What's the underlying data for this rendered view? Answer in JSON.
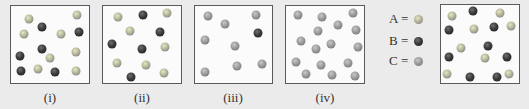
{
  "colors": {
    "background": "#ebebeb",
    "box_fill": "#fbfbfb",
    "box_border": "#5a5a5a",
    "A": "#bfc0a0",
    "B": "#2e2e2e",
    "C": "#9a9a9a"
  },
  "legend": [
    {
      "label": "A =",
      "type": "A"
    },
    {
      "label": "B =",
      "type": "B"
    },
    {
      "label": "C =",
      "type": "C"
    }
  ],
  "boxes": [
    {
      "label": "(i)",
      "x": 10,
      "y": 5,
      "w": 80,
      "h": 79,
      "spheres": [
        {
          "t": "A",
          "x": 29,
          "y": 19
        },
        {
          "t": "A",
          "x": 77,
          "y": 15
        },
        {
          "t": "B",
          "x": 42,
          "y": 27
        },
        {
          "t": "A",
          "x": 24,
          "y": 34
        },
        {
          "t": "A",
          "x": 61,
          "y": 34
        },
        {
          "t": "B",
          "x": 79,
          "y": 32
        },
        {
          "t": "B",
          "x": 42,
          "y": 49
        },
        {
          "t": "B",
          "x": 20,
          "y": 56
        },
        {
          "t": "A",
          "x": 50,
          "y": 58
        },
        {
          "t": "A",
          "x": 76,
          "y": 52
        },
        {
          "t": "B",
          "x": 21,
          "y": 71
        },
        {
          "t": "A",
          "x": 38,
          "y": 69
        },
        {
          "t": "B",
          "x": 55,
          "y": 72
        },
        {
          "t": "A",
          "x": 76,
          "y": 71
        }
      ]
    },
    {
      "label": "(ii)",
      "x": 102,
      "y": 5,
      "w": 80,
      "h": 79,
      "spheres": [
        {
          "t": "A",
          "x": 118,
          "y": 17
        },
        {
          "t": "B",
          "x": 143,
          "y": 15
        },
        {
          "t": "A",
          "x": 167,
          "y": 13
        },
        {
          "t": "A",
          "x": 130,
          "y": 31
        },
        {
          "t": "B",
          "x": 160,
          "y": 32
        },
        {
          "t": "B",
          "x": 112,
          "y": 44
        },
        {
          "t": "B",
          "x": 142,
          "y": 49
        },
        {
          "t": "A",
          "x": 165,
          "y": 47
        },
        {
          "t": "A",
          "x": 117,
          "y": 63
        },
        {
          "t": "A",
          "x": 146,
          "y": 65
        },
        {
          "t": "B",
          "x": 131,
          "y": 77
        },
        {
          "t": "A",
          "x": 164,
          "y": 73
        }
      ]
    },
    {
      "label": "(iii)",
      "x": 194,
      "y": 5,
      "w": 79,
      "h": 79,
      "spheres": [
        {
          "t": "C",
          "x": 208,
          "y": 16
        },
        {
          "t": "C",
          "x": 225,
          "y": 24
        },
        {
          "t": "C",
          "x": 256,
          "y": 15
        },
        {
          "t": "B",
          "x": 258,
          "y": 33
        },
        {
          "t": "C",
          "x": 205,
          "y": 40
        },
        {
          "t": "C",
          "x": 235,
          "y": 46
        },
        {
          "t": "C",
          "x": 237,
          "y": 66
        },
        {
          "t": "C",
          "x": 262,
          "y": 64
        },
        {
          "t": "C",
          "x": 205,
          "y": 72
        }
      ]
    },
    {
      "label": "(iv)",
      "x": 285,
      "y": 5,
      "w": 80,
      "h": 79,
      "spheres": [
        {
          "t": "C",
          "x": 298,
          "y": 15
        },
        {
          "t": "C",
          "x": 322,
          "y": 17
        },
        {
          "t": "C",
          "x": 353,
          "y": 13
        },
        {
          "t": "C",
          "x": 318,
          "y": 31
        },
        {
          "t": "C",
          "x": 338,
          "y": 25
        },
        {
          "t": "C",
          "x": 356,
          "y": 30
        },
        {
          "t": "C",
          "x": 301,
          "y": 41
        },
        {
          "t": "C",
          "x": 316,
          "y": 49
        },
        {
          "t": "C",
          "x": 331,
          "y": 44
        },
        {
          "t": "C",
          "x": 358,
          "y": 47
        },
        {
          "t": "C",
          "x": 296,
          "y": 62
        },
        {
          "t": "C",
          "x": 321,
          "y": 65
        },
        {
          "t": "C",
          "x": 348,
          "y": 63
        },
        {
          "t": "C",
          "x": 306,
          "y": 74
        },
        {
          "t": "C",
          "x": 332,
          "y": 75
        },
        {
          "t": "C",
          "x": 355,
          "y": 76
        }
      ]
    },
    {
      "label": "",
      "x": 440,
      "y": 4,
      "w": 80,
      "h": 80,
      "spheres": [
        {
          "t": "A",
          "x": 452,
          "y": 16
        },
        {
          "t": "B",
          "x": 473,
          "y": 11
        },
        {
          "t": "A",
          "x": 500,
          "y": 13
        },
        {
          "t": "B",
          "x": 449,
          "y": 30
        },
        {
          "t": "A",
          "x": 474,
          "y": 29
        },
        {
          "t": "B",
          "x": 494,
          "y": 27
        },
        {
          "t": "A",
          "x": 511,
          "y": 26
        },
        {
          "t": "A",
          "x": 461,
          "y": 48
        },
        {
          "t": "B",
          "x": 488,
          "y": 46
        },
        {
          "t": "B",
          "x": 449,
          "y": 57
        },
        {
          "t": "A",
          "x": 485,
          "y": 58
        },
        {
          "t": "B",
          "x": 507,
          "y": 57
        },
        {
          "t": "A",
          "x": 447,
          "y": 74
        },
        {
          "t": "B",
          "x": 470,
          "y": 77
        },
        {
          "t": "B",
          "x": 497,
          "y": 77
        },
        {
          "t": "A",
          "x": 509,
          "y": 74
        }
      ]
    }
  ]
}
